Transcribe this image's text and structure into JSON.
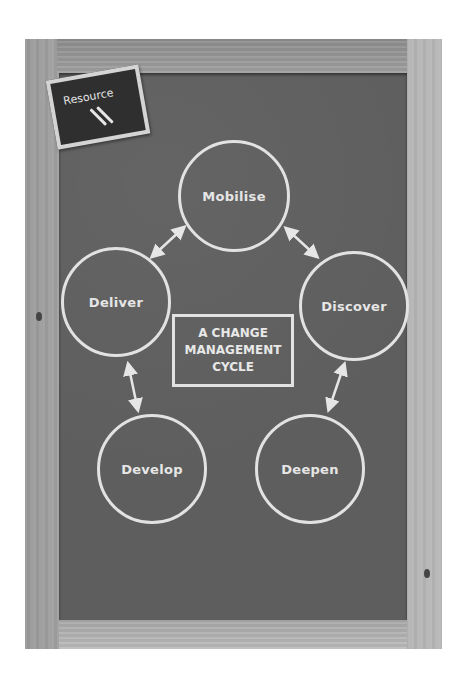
{
  "diagram": {
    "title_lines": [
      "A CHANGE",
      "MANAGEMENT",
      "CYCLE"
    ],
    "badge": {
      "label": "Resource"
    },
    "stages": [
      {
        "id": "mobilise",
        "label": "Mobilise"
      },
      {
        "id": "discover",
        "label": "Discover"
      },
      {
        "id": "deepen",
        "label": "Deepen"
      },
      {
        "id": "develop",
        "label": "Develop"
      },
      {
        "id": "deliver",
        "label": "Deliver"
      }
    ],
    "connections": [
      {
        "from": "deliver",
        "to": "mobilise",
        "type": "bidirectional"
      },
      {
        "from": "mobilise",
        "to": "discover",
        "type": "bidirectional"
      },
      {
        "from": "discover",
        "to": "deepen",
        "type": "bidirectional"
      },
      {
        "from": "deliver",
        "to": "develop",
        "type": "bidirectional"
      }
    ],
    "colors": {
      "chalkboard": "#5e5e5e",
      "chalk": "#e2e2e2",
      "frame_wood": "#a8a8a8",
      "badge_board": "#2f2f2f"
    }
  }
}
